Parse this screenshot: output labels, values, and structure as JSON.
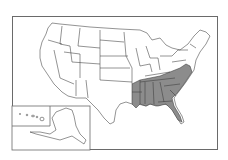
{
  "map": {
    "title": "",
    "subject": "United States",
    "highlight_color": "#8c8c8c",
    "base_color": "#ffffff",
    "border_color": "#3a3a3a",
    "highlighted_states": [
      "Arkansas",
      "Louisiana",
      "Mississippi",
      "Alabama",
      "Georgia",
      "Florida",
      "Tennessee",
      "Kentucky",
      "Virginia",
      "North Carolina",
      "South Carolina",
      "Maryland",
      "Delaware"
    ],
    "insets": [
      "Alaska",
      "Hawaii"
    ]
  }
}
